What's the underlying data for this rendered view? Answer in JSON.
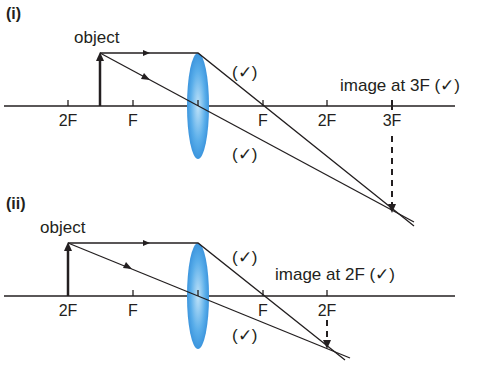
{
  "colors": {
    "line": "#231f20",
    "lens_light": "#a9d7f5",
    "lens_dark": "#2f8fdd"
  },
  "diagrams": [
    {
      "panel_label": "(i)",
      "object_label": "object",
      "axis_labels": [
        "2F",
        "F",
        "F",
        "2F",
        "3F"
      ],
      "image_label": "image at 3F (✓)",
      "check_marks": [
        "(✓)",
        "(✓)"
      ],
      "object_position": "between 2F and F",
      "image_position": "3F"
    },
    {
      "panel_label": "(ii)",
      "object_label": "object",
      "axis_labels": [
        "2F",
        "F",
        "F",
        "2F"
      ],
      "image_label": "image at 2F (✓)",
      "check_marks": [
        "(✓)",
        "(✓)"
      ],
      "object_position": "2F",
      "image_position": "2F"
    }
  ]
}
